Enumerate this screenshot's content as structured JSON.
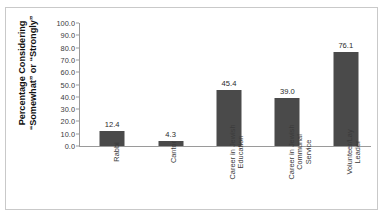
{
  "chart_data": {
    "type": "bar",
    "title": "",
    "subtitle": "",
    "xlabel": "",
    "ylabel": "Percentage Considering “Somewhat” or “Strongly”",
    "ylabel_lines": [
      "Percentage Considering",
      "“Somewhat” or “Strongly”"
    ],
    "categories": [
      "Rabbi",
      "Cantor",
      "Career in Jewish Education",
      "Career in Jewish Communal Service",
      "Volunteer/Lay Leader"
    ],
    "category_lines": [
      [
        "Rabbi"
      ],
      [
        "Cantor"
      ],
      [
        "Career in Jewish",
        "Education"
      ],
      [
        "Career in Jewish",
        "Communal",
        "Service"
      ],
      [
        "Volunteer/Lay",
        "Leader"
      ]
    ],
    "values": [
      12.4,
      4.3,
      45.4,
      39.0,
      76.1
    ],
    "value_labels": [
      "12.4",
      "4.3",
      "45.4",
      "39.0",
      "76.1"
    ],
    "ylim": [
      0.0,
      100.0
    ],
    "ytick_values": [
      0.0,
      10.0,
      20.0,
      30.0,
      40.0,
      50.0,
      60.0,
      70.0,
      80.0,
      90.0,
      100.0
    ],
    "ytick_labels": [
      "0.0",
      "10.0",
      "20.0",
      "30.0",
      "40.0",
      "50.0",
      "60.0",
      "70.0",
      "80.0",
      "90.0",
      "100.0"
    ],
    "grid": false,
    "legend": null,
    "legend_position": "none",
    "bar_color": "#4a4a4a",
    "axis_color": "#9a9a9a",
    "frame_color": "#c9c9c9",
    "background_color": "#ffffff",
    "text_color": "#3b3b3b"
  }
}
